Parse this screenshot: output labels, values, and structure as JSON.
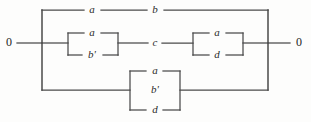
{
  "figure": {
    "name": "relay-contact-network",
    "background_color": "#fdfdfc",
    "line_color": "#4a4a4a",
    "text_color": "#2b2b2b"
  },
  "terminals": {
    "left": "0",
    "right": "0"
  },
  "branches": {
    "top": {
      "contacts": [
        "a",
        "b"
      ]
    },
    "middle": {
      "left_parallel": [
        "a",
        "b'"
      ],
      "series_contact": "c",
      "right_parallel": [
        "a",
        "d"
      ]
    },
    "bottom": {
      "parallel": [
        "a",
        "b'",
        "d"
      ]
    }
  },
  "labels": {
    "top_a": "a",
    "top_b": "b",
    "mid_left_a": "a",
    "mid_left_bprime": "b'",
    "mid_c": "c",
    "mid_right_a": "a",
    "mid_right_d": "d",
    "bottom_a": "a",
    "bottom_bprime": "b'",
    "bottom_d": "d"
  }
}
